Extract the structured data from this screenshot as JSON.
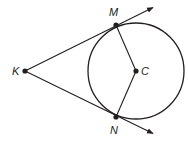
{
  "diagram": {
    "stroke_color": "#231f20",
    "background": "#ffffff",
    "circle": {
      "name": "C",
      "cx": 136,
      "cy": 71,
      "r": 48
    },
    "points": [
      {
        "name": "K",
        "label": "K",
        "x": 25,
        "y": 71,
        "label_x": 12,
        "label_y": 75
      },
      {
        "name": "M",
        "label": "M",
        "x": 116,
        "y": 25,
        "label_x": 109,
        "label_y": 16
      },
      {
        "name": "N",
        "label": "N",
        "x": 116,
        "y": 117,
        "label_x": 110,
        "label_y": 134
      },
      {
        "name": "C",
        "label": "C",
        "x": 136,
        "y": 71,
        "label_x": 141,
        "label_y": 75
      }
    ],
    "rays": [
      {
        "name": "ray-KM",
        "from": "K",
        "through": "M",
        "end_x": 154,
        "end_y": 7
      },
      {
        "name": "ray-KN",
        "from": "K",
        "through": "N",
        "end_x": 154,
        "end_y": 134
      }
    ],
    "segments": [
      {
        "name": "segment-MC",
        "from": "M",
        "to": "C"
      },
      {
        "name": "segment-NC",
        "from": "N",
        "to": "C"
      }
    ]
  }
}
